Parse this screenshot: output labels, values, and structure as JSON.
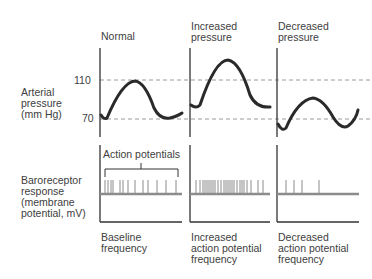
{
  "panels": [
    {
      "title_line1": "Normal",
      "title_line2": "",
      "bottom_line1": "Baseline",
      "bottom_line2": "frequency",
      "bottom_line3": ""
    },
    {
      "title_line1": "Increased",
      "title_line2": "pressure",
      "bottom_line1": "Increased",
      "bottom_line2": "action potential",
      "bottom_line3": "frequency"
    },
    {
      "title_line1": "Decreased",
      "title_line2": "pressure",
      "bottom_line1": "Decreased",
      "bottom_line2": "action potential",
      "bottom_line3": "frequency"
    }
  ],
  "left_labels": {
    "arterial": [
      "Arterial",
      "pressure",
      "(mm Hg)"
    ],
    "baroreceptor": [
      "Baroreceptor",
      "response",
      "(membrane",
      "potential, mV)"
    ]
  },
  "y_ticks": {
    "high": "110",
    "low": "70"
  },
  "annotation": "Action potentials",
  "colors": {
    "curve": "#2a2a2a",
    "axis": "#333333",
    "dash": "#9a9a9a",
    "membrane": "#8c8c8c"
  }
}
